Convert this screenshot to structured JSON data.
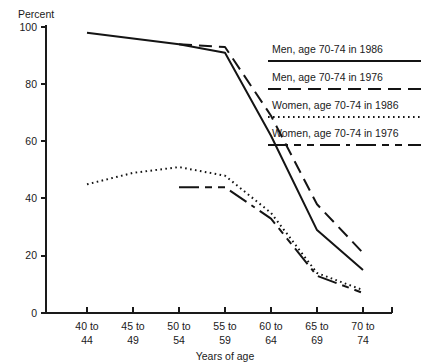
{
  "chart_data": {
    "type": "line",
    "title": "",
    "subtitle": "",
    "xlabel": "Years of age",
    "ylabel": "Percent",
    "categories": [
      "40 to 44",
      "45 to 49",
      "50 to 54",
      "55 to 59",
      "60 to 64",
      "65 to 69",
      "70 to 74"
    ],
    "xtick_lines": [
      [
        "40 to",
        "44"
      ],
      [
        "45 to",
        "49"
      ],
      [
        "50 to",
        "54"
      ],
      [
        "55 to",
        "59"
      ],
      [
        "60 to",
        "64"
      ],
      [
        "65 to",
        "69"
      ],
      [
        "70 to",
        "74"
      ]
    ],
    "ylim": [
      0,
      100
    ],
    "yticks": [
      0,
      20,
      40,
      60,
      80,
      100
    ],
    "ytick_labels": [
      "0",
      "20",
      "40",
      "60",
      "80",
      "100"
    ],
    "grid": false,
    "legend_position": "upper right",
    "series": [
      {
        "name": "Men, age 70-74 in 1986",
        "style": "solid",
        "color": "#141414",
        "x": [
          "40 to 44",
          "45 to 49",
          "50 to 54",
          "55 to 59",
          "60 to 64",
          "65 to 69",
          "70 to 74"
        ],
        "values": [
          98,
          96,
          94,
          91,
          62,
          29,
          15
        ]
      },
      {
        "name": "Men, age 70-74 in 1976",
        "style": "dashed",
        "color": "#141414",
        "x": [
          "50 to 54",
          "55 to 59",
          "60 to 64",
          "65 to 69",
          "70 to 74"
        ],
        "values": [
          94,
          93,
          69,
          38,
          21
        ]
      },
      {
        "name": "Women, age 70-74 in 1986",
        "style": "dotted",
        "color": "#141414",
        "x": [
          "40 to 44",
          "45 to 49",
          "50 to 54",
          "55 to 59",
          "60 to 64",
          "65 to 69",
          "70 to 74"
        ],
        "values": [
          45,
          49,
          51,
          48,
          35,
          14,
          8
        ]
      },
      {
        "name": "Women, age 70-74 in 1976",
        "style": "dashdash",
        "color": "#141414",
        "x": [
          "50 to 54",
          "55 to 59",
          "60 to 64",
          "65 to 69",
          "70 to 74"
        ],
        "values": [
          44,
          44,
          33,
          13,
          7
        ]
      }
    ],
    "legend_entries": [
      {
        "label": "Men, age 70-74 in 1986",
        "style": "solid"
      },
      {
        "label": "Men, age 70-74 in 1976",
        "style": "dashed"
      },
      {
        "label": "Women, age 70-74 in 1986",
        "style": "dotted"
      },
      {
        "label": "Women, age 70-74 in 1976",
        "style": "dashdash"
      }
    ]
  }
}
